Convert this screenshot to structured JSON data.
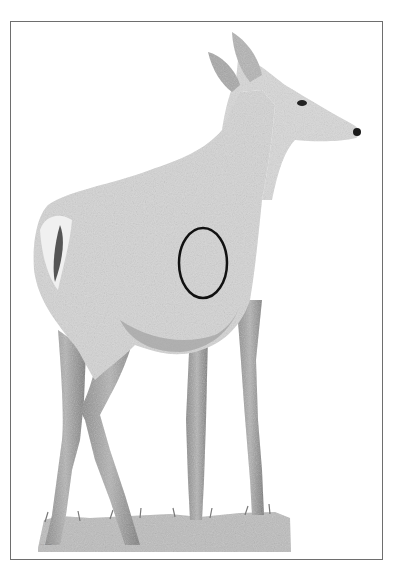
{
  "page": {
    "colors": {
      "frame": "#6e6e6e",
      "body_fill": "#d2d2d2",
      "body_shade": "#9a9a9a",
      "dark": "#2a2a2a",
      "grass": "#b8b8b8",
      "target_ring": "#111111"
    }
  },
  "target": {
    "label": "vital-zone-ellipse",
    "cx": 203,
    "cy": 263,
    "rx": 24,
    "ry": 35
  },
  "caption": {
    "text": "····· ····"
  }
}
